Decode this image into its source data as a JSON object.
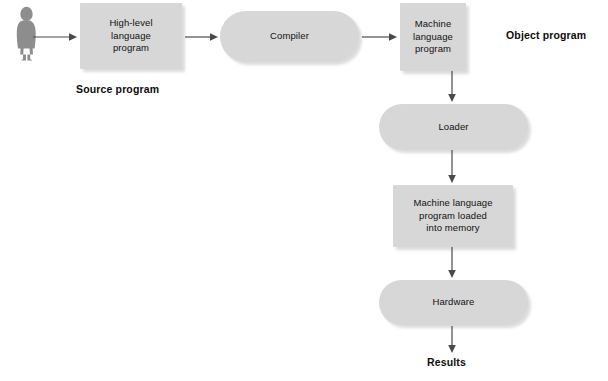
{
  "diagram": {
    "background_color": "#ffffff",
    "node_fill_color": "#d7d7d7",
    "text_color": "#111111",
    "caption_color": "#0d0d0d",
    "arrow_color": "#4a4a4a",
    "person_color": "#8a8a8a"
  },
  "actor": {
    "icon": "person-silhouette-icon",
    "label": ""
  },
  "nodes": [
    {
      "id": "high-level-language-program",
      "label": "High-level\nlanguage\nprogram",
      "shape": "rect",
      "x": 80,
      "y": 3,
      "w": 102,
      "h": 66
    },
    {
      "id": "compiler",
      "label": "Compiler",
      "shape": "pill",
      "x": 220,
      "y": 11,
      "w": 139,
      "h": 51
    },
    {
      "id": "machine-language-program",
      "label": "Machine\nlanguage\nprogram",
      "shape": "rect",
      "x": 400,
      "y": 3,
      "w": 66,
      "h": 68
    },
    {
      "id": "loader",
      "label": "Loader",
      "shape": "pill",
      "x": 379,
      "y": 104,
      "w": 149,
      "h": 46
    },
    {
      "id": "machine-language-program-loaded-into-memory",
      "label": "Machine language\nprogram loaded\ninto memory",
      "shape": "rect",
      "x": 393,
      "y": 185,
      "w": 120,
      "h": 62
    },
    {
      "id": "hardware",
      "label": "Hardware",
      "shape": "pill",
      "x": 379,
      "y": 280,
      "w": 149,
      "h": 45
    }
  ],
  "captions": [
    {
      "id": "source-program-caption",
      "text": "Source program",
      "x": 76,
      "y": 83
    },
    {
      "id": "object-program-caption",
      "text": "Object program",
      "x": 506,
      "y": 29
    },
    {
      "id": "results-caption",
      "text": "Results",
      "x": 427,
      "y": 356
    }
  ],
  "arrows": [
    {
      "id": "actor-to-source",
      "direction": "right",
      "x1": 33,
      "y1": 37,
      "x2": 76,
      "y2": 37
    },
    {
      "id": "source-to-compiler",
      "direction": "right",
      "x1": 185,
      "y1": 37,
      "x2": 217,
      "y2": 37
    },
    {
      "id": "compiler-to-object",
      "direction": "right",
      "x1": 362,
      "y1": 37,
      "x2": 396,
      "y2": 37
    },
    {
      "id": "object-to-loader",
      "direction": "down",
      "x1": 452,
      "y1": 72,
      "x2": 452,
      "y2": 101
    },
    {
      "id": "loader-to-memory",
      "direction": "down",
      "x1": 452,
      "y1": 151,
      "x2": 452,
      "y2": 182
    },
    {
      "id": "memory-to-hardware",
      "direction": "down",
      "x1": 452,
      "y1": 248,
      "x2": 452,
      "y2": 277
    },
    {
      "id": "hardware-to-results",
      "direction": "down",
      "x1": 452,
      "y1": 327,
      "x2": 452,
      "y2": 352
    }
  ]
}
